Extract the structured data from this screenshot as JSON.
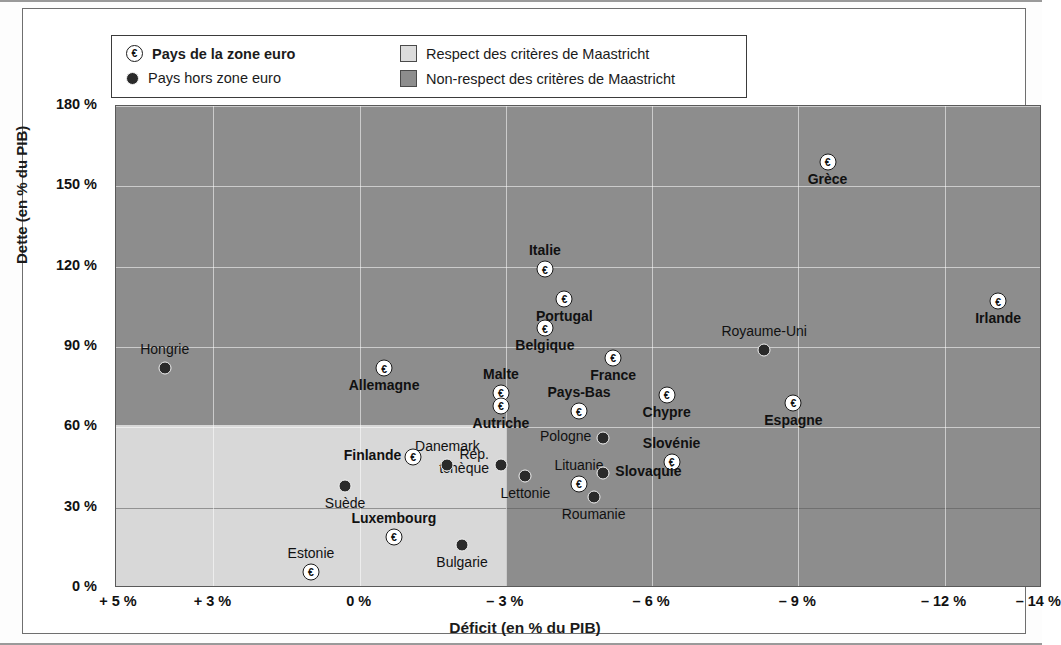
{
  "legend": {
    "euro_label": "Pays de la zone euro",
    "non_euro_label": "Pays hors zone euro",
    "respect_label": "Respect des critères de Maastricht",
    "non_respect_label": "Non-respect des critères de Maastricht",
    "euro_symbol": "€",
    "colors": {
      "light": "#d8d8d8",
      "dark": "#8d8d8d",
      "marker": "#2a2a2a"
    }
  },
  "chart_data": {
    "type": "scatter",
    "title": "",
    "xlabel": "Déficit (en % du PIB)",
    "ylabel": "Dette (en % du PIB)",
    "xticklabels": [
      "+ 5 %",
      "+ 3 %",
      "0 %",
      "– 3 %",
      "– 6 %",
      "– 9 %",
      "– 12 %",
      "– 14 %"
    ],
    "xtickvalues": [
      5,
      3,
      0,
      -3,
      -6,
      -9,
      -12,
      -14
    ],
    "yticklabels": [
      "0 %",
      "30 %",
      "60 %",
      "90 %",
      "120 %",
      "150 %",
      "180 %"
    ],
    "ytickvalues": [
      0,
      30,
      60,
      90,
      120,
      150,
      180
    ],
    "xlim": [
      5,
      -14
    ],
    "ylim": [
      0,
      180
    ],
    "grid": true,
    "legend_position": "top-left",
    "maastricht_thresholds": {
      "deficit": -3,
      "debt": 60
    },
    "points": [
      {
        "name": "Hongrie",
        "deficit": 4.0,
        "debt": 82,
        "euro": false,
        "label_pos": "above",
        "bold": false
      },
      {
        "name": "Allemagne",
        "deficit": -0.5,
        "debt": 82,
        "euro": true,
        "label_pos": "below",
        "bold": true
      },
      {
        "name": "Malte",
        "deficit": -2.9,
        "debt": 73,
        "euro": true,
        "label_pos": "above",
        "bold": true
      },
      {
        "name": "Autriche",
        "deficit": -2.9,
        "debt": 68,
        "euro": true,
        "label_pos": "below",
        "bold": true
      },
      {
        "name": "Belgique",
        "deficit": -3.8,
        "debt": 97,
        "euro": true,
        "label_pos": "below",
        "bold": true
      },
      {
        "name": "Portugal",
        "deficit": -4.2,
        "debt": 108,
        "euro": true,
        "label_pos": "below",
        "bold": true
      },
      {
        "name": "Italie",
        "deficit": -3.8,
        "debt": 119,
        "euro": true,
        "label_pos": "above",
        "bold": true
      },
      {
        "name": "France",
        "deficit": -5.2,
        "debt": 86,
        "euro": true,
        "label_pos": "below",
        "bold": true
      },
      {
        "name": "Pays-Bas",
        "deficit": -4.5,
        "debt": 66,
        "euro": true,
        "label_pos": "above",
        "bold": true
      },
      {
        "name": "Chypre",
        "deficit": -6.3,
        "debt": 72,
        "euro": true,
        "label_pos": "below",
        "bold": true
      },
      {
        "name": "Royaume-Uni",
        "deficit": -8.3,
        "debt": 89,
        "euro": false,
        "label_pos": "above",
        "bold": false
      },
      {
        "name": "Grèce",
        "deficit": -9.6,
        "debt": 159,
        "euro": true,
        "label_pos": "below",
        "bold": true
      },
      {
        "name": "Irlande",
        "deficit": -13.1,
        "debt": 107,
        "euro": true,
        "label_pos": "below",
        "bold": true
      },
      {
        "name": "Espagne",
        "deficit": -8.9,
        "debt": 69,
        "euro": true,
        "label_pos": "below",
        "bold": true
      },
      {
        "name": "Pologne",
        "deficit": -5.0,
        "debt": 56,
        "euro": false,
        "label_pos": "left",
        "bold": false
      },
      {
        "name": "Slovénie",
        "deficit": -6.4,
        "debt": 47,
        "euro": true,
        "label_pos": "above",
        "bold": true
      },
      {
        "name": "Lituanie",
        "deficit": -4.5,
        "debt": 39,
        "euro": true,
        "label_pos": "above",
        "bold": false
      },
      {
        "name": "Slovaquie",
        "deficit": -5.0,
        "debt": 43,
        "euro": false,
        "label_pos": "right",
        "bold": true
      },
      {
        "name": "Roumanie",
        "deficit": -4.8,
        "debt": 34,
        "euro": false,
        "label_pos": "below",
        "bold": false
      },
      {
        "name": "Lettonie",
        "deficit": -3.4,
        "debt": 42,
        "euro": false,
        "label_pos": "below",
        "bold": false
      },
      {
        "name": "Rép. tchèque",
        "deficit": -2.9,
        "debt": 46,
        "euro": false,
        "label_pos": "left-two",
        "bold": false
      },
      {
        "name": "Danemark",
        "deficit": -1.8,
        "debt": 46,
        "euro": false,
        "label_pos": "above",
        "bold": false
      },
      {
        "name": "Finlande",
        "deficit": -1.1,
        "debt": 49,
        "euro": true,
        "label_pos": "left",
        "bold": true
      },
      {
        "name": "Suède",
        "deficit": 0.3,
        "debt": 38,
        "euro": false,
        "label_pos": "below",
        "bold": false
      },
      {
        "name": "Luxembourg",
        "deficit": -0.7,
        "debt": 19,
        "euro": true,
        "label_pos": "above",
        "bold": true
      },
      {
        "name": "Estonie",
        "deficit": 1.0,
        "debt": 6,
        "euro": true,
        "label_pos": "above",
        "bold": false
      },
      {
        "name": "Bulgarie",
        "deficit": -2.1,
        "debt": 16,
        "euro": false,
        "label_pos": "below",
        "bold": false
      }
    ]
  }
}
